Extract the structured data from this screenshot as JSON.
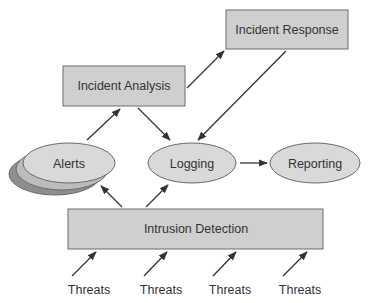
{
  "diagram": {
    "colors": {
      "box_fill": "#cfcfcf",
      "ellipse_fill": "#d9d9d9",
      "alerts_middle_fill": "#bcbcbc",
      "alerts_back_fill": "#8e8e8e",
      "stroke": "#6a6a6a",
      "arrow": "#333333",
      "text": "#333333"
    },
    "nodes": {
      "incident_response": {
        "label": "Incident Response",
        "shape": "rectangle"
      },
      "incident_analysis": {
        "label": "Incident Analysis",
        "shape": "rectangle"
      },
      "alerts": {
        "label": "Alerts",
        "shape": "stacked-ellipse"
      },
      "logging": {
        "label": "Logging",
        "shape": "ellipse"
      },
      "reporting": {
        "label": "Reporting",
        "shape": "ellipse"
      },
      "intrusion_detection": {
        "label": "Intrusion Detection",
        "shape": "rectangle"
      }
    },
    "threats": [
      {
        "label": "Threats"
      },
      {
        "label": "Threats"
      },
      {
        "label": "Threats"
      },
      {
        "label": "Threats"
      }
    ],
    "edges": [
      {
        "from": "Alerts",
        "to": "Incident Analysis"
      },
      {
        "from": "Incident Analysis",
        "to": "Incident Response"
      },
      {
        "from": "Incident Analysis",
        "to": "Logging"
      },
      {
        "from": "Incident Response",
        "to": "Logging"
      },
      {
        "from": "Logging",
        "to": "Reporting"
      },
      {
        "from": "Intrusion Detection",
        "to": "Alerts"
      },
      {
        "from": "Intrusion Detection",
        "to": "Logging"
      },
      {
        "from": "Threats",
        "to": "Intrusion Detection"
      },
      {
        "from": "Threats",
        "to": "Intrusion Detection"
      },
      {
        "from": "Threats",
        "to": "Intrusion Detection"
      },
      {
        "from": "Threats",
        "to": "Intrusion Detection"
      }
    ]
  }
}
